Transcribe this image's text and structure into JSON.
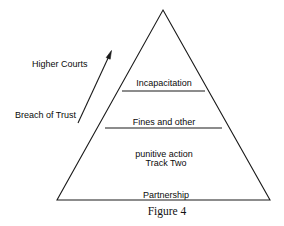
{
  "figure": {
    "caption": "Figure 4",
    "shape": "pyramid",
    "background_color": "#ffffff",
    "line_color": "#1a1a1a",
    "text_color": "#0a0a0a"
  },
  "pyramid": {
    "apex": {
      "x": 163,
      "y": 10
    },
    "base_left": {
      "x": 57,
      "y": 200
    },
    "base_right": {
      "x": 270,
      "y": 200
    },
    "tiers": [
      {
        "id": "incapacitation",
        "label": "Incapacitation",
        "order": 1,
        "position": "upper",
        "lines": [
          "Incapacitation"
        ]
      },
      {
        "id": "fines-and-other-punitive-action",
        "label": "Fines and other punitive action",
        "order": 2,
        "position": "middle",
        "lines": [
          "Fines and other",
          "punitive action"
        ]
      },
      {
        "id": "track-two-partnership",
        "label": "Track Two Partnership",
        "order": 3,
        "position": "lower",
        "lines": [
          "Track Two",
          "Partnership"
        ]
      }
    ],
    "dividers": [
      {
        "id": "divider-upper",
        "y": 91,
        "x1": 122,
        "x2": 205
      },
      {
        "id": "divider-lower",
        "y": 128,
        "x1": 105,
        "x2": 222
      }
    ]
  },
  "annotations": {
    "arrow": {
      "id": "escalation-arrow",
      "from": {
        "x": 78,
        "y": 123
      },
      "to": {
        "x": 111,
        "y": 52
      },
      "direction": "up-right",
      "head": "at-top"
    },
    "labels": [
      {
        "id": "higher-courts",
        "text": "Higher Courts"
      },
      {
        "id": "breach-of-trust",
        "text": "Breach of Trust"
      }
    ]
  }
}
